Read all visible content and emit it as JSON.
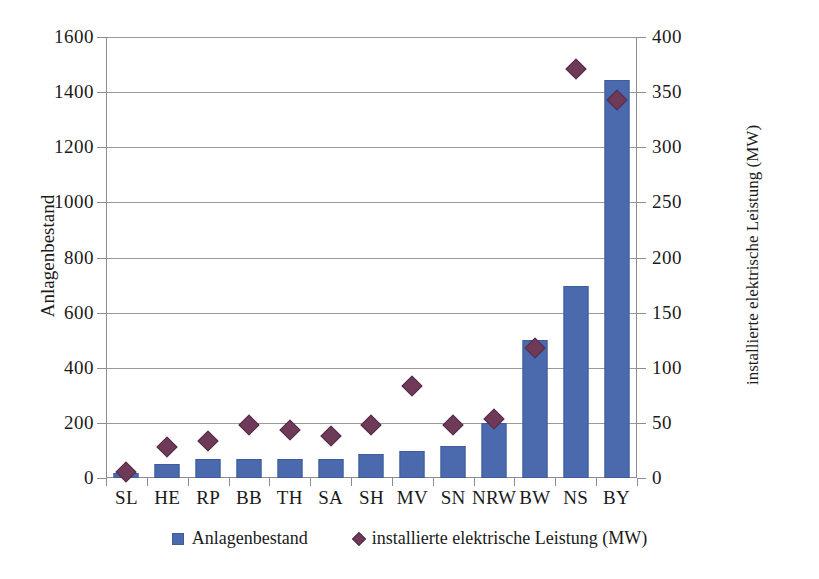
{
  "chart_data": {
    "type": "bar",
    "title": "",
    "xlabel": "",
    "ylabel": "Anlagenbestand",
    "y2label": "installierte elektrische Leistung (MW)",
    "categories": [
      "SL",
      "HE",
      "RP",
      "BB",
      "TH",
      "SA",
      "SH",
      "MV",
      "SN",
      "NRW",
      "BW",
      "NS",
      "BY"
    ],
    "ylim": [
      0,
      1600
    ],
    "yticks": [
      0,
      200,
      400,
      600,
      800,
      1000,
      1200,
      1400,
      1600
    ],
    "y2lim": [
      0,
      400
    ],
    "y2ticks": [
      0,
      50,
      100,
      150,
      200,
      250,
      300,
      350,
      400
    ],
    "grid": true,
    "legend_position": "bottom",
    "series": [
      {
        "name": "Anlagenbestand",
        "type": "bar",
        "axis": "left",
        "color": "#4a6aad",
        "values": [
          20,
          50,
          70,
          70,
          70,
          70,
          88,
          98,
          115,
          200,
          500,
          695,
          1445
        ]
      },
      {
        "name": "installierte elektrische Leistung (MW)",
        "type": "scatter",
        "axis": "right",
        "color": "#6e3a58",
        "marker": "diamond",
        "values": [
          12,
          35,
          40,
          55,
          50,
          45,
          55,
          90,
          55,
          60,
          125,
          378,
          350
        ]
      }
    ]
  },
  "axes": {
    "left": {
      "title": "Anlagenbestand",
      "ticks": [
        "0",
        "200",
        "400",
        "600",
        "800",
        "1000",
        "1200",
        "1400",
        "1600"
      ]
    },
    "right": {
      "title": "installierte elektrische Leistung (MW)",
      "ticks": [
        "0",
        "50",
        "100",
        "150",
        "200",
        "250",
        "300",
        "350",
        "400"
      ]
    },
    "x": {
      "ticks": [
        "SL",
        "HE",
        "RP",
        "BB",
        "TH",
        "SA",
        "SH",
        "MV",
        "SN",
        "NRW",
        "BW",
        "NS",
        "BY"
      ]
    }
  },
  "legend": {
    "items": [
      {
        "label": "Anlagenbestand",
        "marker": "square",
        "color": "#4a6aad"
      },
      {
        "label": "installierte elektrische Leistung (MW)",
        "marker": "diamond",
        "color": "#6e3a58"
      }
    ]
  }
}
